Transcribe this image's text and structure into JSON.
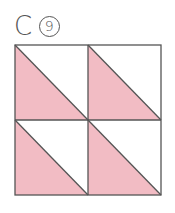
{
  "label": {
    "letter": "C",
    "number": "9"
  },
  "colors": {
    "fill": "#f2bcc4",
    "stroke": "#555555",
    "background": "#ffffff"
  },
  "grid": {
    "rows": 2,
    "cols": 2,
    "cells": [
      {
        "row": 0,
        "col": 0,
        "shaded": "bottom-left",
        "diagonal": "top-left-to-bottom-right"
      },
      {
        "row": 0,
        "col": 1,
        "shaded": "bottom-left",
        "diagonal": "top-left-to-bottom-right"
      },
      {
        "row": 1,
        "col": 0,
        "shaded": "bottom-left",
        "diagonal": "top-left-to-bottom-right"
      },
      {
        "row": 1,
        "col": 1,
        "shaded": "bottom-left",
        "diagonal": "top-left-to-bottom-right"
      }
    ]
  }
}
